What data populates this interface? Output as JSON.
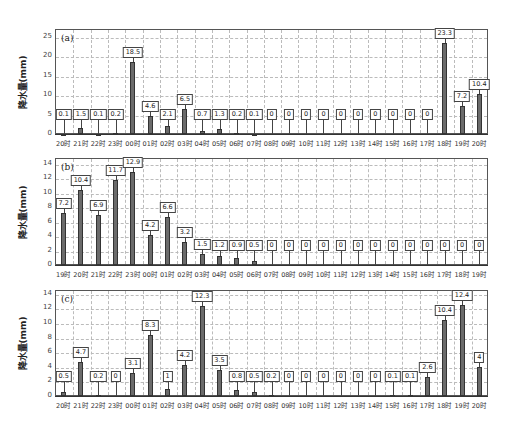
{
  "chart_data": [
    {
      "type": "bar",
      "panel": "(a)",
      "ylabel": "降水量(mm)",
      "ylim": [
        0,
        27
      ],
      "yticks": [
        0,
        5,
        10,
        15,
        20,
        25
      ],
      "grid": true,
      "categories": [
        "20时",
        "21时",
        "22时",
        "23时",
        "00时",
        "01时",
        "02时",
        "03时",
        "04时",
        "05时",
        "06时",
        "07时",
        "08时",
        "09时",
        "10时",
        "11时",
        "12时",
        "13时",
        "14时",
        "15时",
        "16时",
        "17时",
        "18时",
        "19时",
        "20时"
      ],
      "values": [
        0.1,
        1.5,
        0.1,
        0.2,
        18.5,
        4.6,
        2.1,
        6.5,
        0.7,
        1.3,
        0.2,
        0.1,
        0,
        0,
        0,
        0,
        0,
        0,
        0,
        0,
        0,
        0,
        23.3,
        7.2,
        10.4
      ]
    },
    {
      "type": "bar",
      "panel": "(b)",
      "ylabel": "降水量(mm)",
      "ylim": [
        0,
        14.8
      ],
      "yticks": [
        0,
        2,
        4,
        6,
        8,
        10,
        12,
        14
      ],
      "grid": true,
      "categories": [
        "19时",
        "20时",
        "21时",
        "22时",
        "23时",
        "00时",
        "01时",
        "02时",
        "03时",
        "04时",
        "05时",
        "06时",
        "07时",
        "08时",
        "09时",
        "10时",
        "11时",
        "12时",
        "13时",
        "14时",
        "15时",
        "16时",
        "17时",
        "18时",
        "19时"
      ],
      "values": [
        7.2,
        10.4,
        6.9,
        11.7,
        12.9,
        4.2,
        6.6,
        3.2,
        1.5,
        1.2,
        0.9,
        0.5,
        0,
        0,
        0,
        0,
        0,
        0,
        0,
        0,
        0,
        0,
        0,
        0,
        0
      ]
    },
    {
      "type": "bar",
      "panel": "(c)",
      "ylabel": "降水量(mm)",
      "ylim": [
        0,
        14.5
      ],
      "yticks": [
        0,
        2,
        4,
        6,
        8,
        10,
        12,
        14
      ],
      "grid": true,
      "categories": [
        "20时",
        "21时",
        "22时",
        "23时",
        "00时",
        "01时",
        "02时",
        "03时",
        "04时",
        "05时",
        "06时",
        "07时",
        "08时",
        "09时",
        "10时",
        "11时",
        "12时",
        "13时",
        "14时",
        "15时",
        "16时",
        "17时",
        "18时",
        "19时",
        "20时"
      ],
      "values": [
        0.5,
        4.7,
        0.2,
        0,
        3.1,
        8.3,
        1,
        4.2,
        12.3,
        3.5,
        0.8,
        0.5,
        0.2,
        0,
        0,
        0,
        0,
        0,
        0,
        0.1,
        0.1,
        2.6,
        10.4,
        12.4,
        4
      ]
    }
  ],
  "layout": [
    {
      "top": 29,
      "bottom": 134,
      "left": 55,
      "right": 488
    },
    {
      "top": 158,
      "bottom": 265,
      "left": 55,
      "right": 488
    },
    {
      "top": 290,
      "bottom": 396,
      "left": 55,
      "right": 488
    }
  ]
}
